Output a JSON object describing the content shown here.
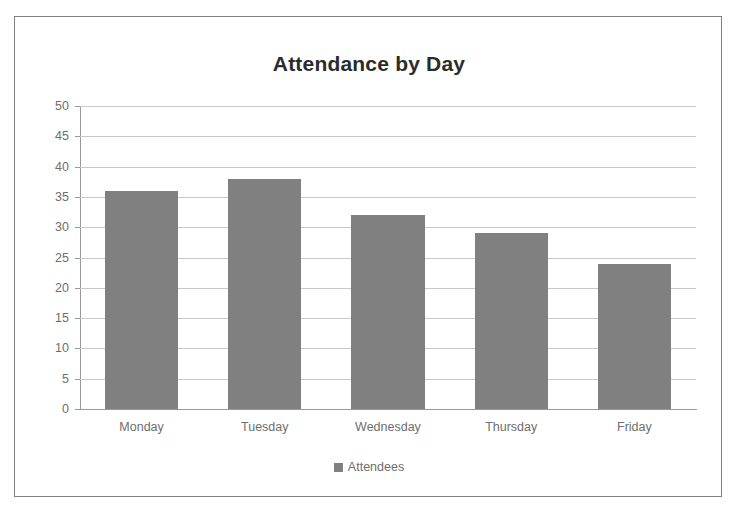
{
  "chart_data": {
    "type": "bar",
    "title": "Attendance by Day",
    "xlabel": "",
    "ylabel": "",
    "categories": [
      "Monday",
      "Tuesday",
      "Wednesday",
      "Thursday",
      "Friday"
    ],
    "values": [
      36,
      38,
      32,
      29,
      24
    ],
    "series": [
      {
        "name": "Attendees",
        "values": [
          36,
          38,
          32,
          29,
          24
        ]
      }
    ],
    "ylim": [
      0,
      50
    ],
    "ytick_step": 5,
    "yticks": [
      50,
      45,
      40,
      35,
      30,
      25,
      20,
      15,
      10,
      5,
      0
    ],
    "ytick_labels": [
      "50",
      "45",
      "40",
      "35",
      "30",
      "25",
      "20",
      "15",
      "10",
      "5",
      "0"
    ],
    "grid": true,
    "grid_axis": "y",
    "legend": true,
    "legend_position": "bottom",
    "legend_entries": [
      "Attendees"
    ],
    "colors": {
      "bar": "#808080",
      "gridline": "#c9c9c9",
      "axis": "#9a9a9a",
      "tick_label": "#6e6e6e",
      "title": "#2b2b2b",
      "border": "#808080",
      "background": "#ffffff"
    }
  },
  "legend": {
    "marker_name": "legend-color-swatch",
    "label": "Attendees"
  }
}
